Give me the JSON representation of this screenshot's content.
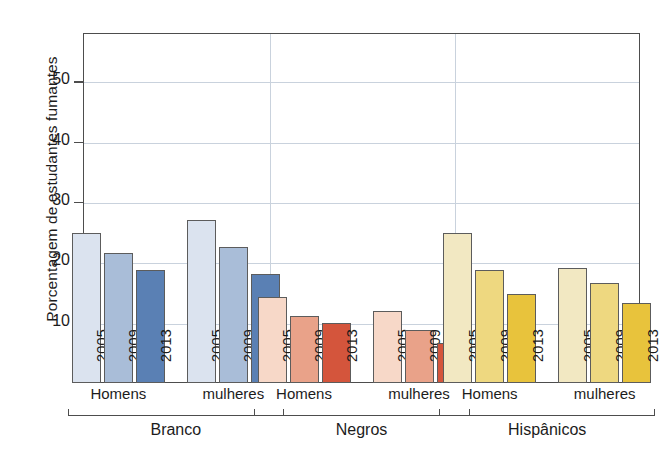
{
  "chart_data": {
    "type": "bar",
    "title": "",
    "subtitle": "",
    "xlabel": "",
    "ylabel": "Porcentagem de estudantes fumantes",
    "ylim": [
      0,
      58
    ],
    "yticks": [
      10,
      20,
      30,
      40,
      50
    ],
    "ytick_labels": [
      "10",
      "20",
      "30",
      "40",
      "50"
    ],
    "grid": "horizontal-and-group-separators",
    "legend": "none",
    "categories": [
      "2005",
      "2009",
      "2013"
    ],
    "groups": [
      {
        "race": "Branco",
        "color_light": "#dbe3ef",
        "color_mid": "#a9bdd8",
        "color_dark": "#5a80b4",
        "subgroups": [
          {
            "sex": "Homens",
            "values": [
              24.8,
              21.5,
              18.8
            ]
          },
          {
            "sex": "mulheres",
            "values": [
              27.0,
              22.6,
              18.0
            ]
          }
        ]
      },
      {
        "race": "Negros",
        "color_light": "#f7d8c8",
        "color_mid": "#e9a289",
        "color_dark": "#d4553c",
        "subgroups": [
          {
            "sex": "Homens",
            "values": [
              14.3,
              11.1,
              10.0
            ]
          },
          {
            "sex": "mulheres",
            "values": [
              12.0,
              8.8,
              6.7
            ]
          }
        ]
      },
      {
        "race": "Hispânicos",
        "color_light": "#f2e8c2",
        "color_mid": "#eed880",
        "color_dark": "#e8c33c",
        "subgroups": [
          {
            "sex": "Homens",
            "values": [
              24.8,
              18.8,
              14.8
            ]
          },
          {
            "sex": "mulheres",
            "values": [
              19.0,
              16.5,
              13.3
            ]
          }
        ]
      }
    ]
  },
  "axis": {
    "y_title": "Porcentagem de estudantes fumantes",
    "y_tick_labels": [
      "50",
      "40",
      "30",
      "20",
      "10"
    ]
  },
  "colors": {
    "frame": "#4d4d4d",
    "gridline": "#c9d2dd",
    "text": "#1c1c1c",
    "background": "#ffffff"
  }
}
